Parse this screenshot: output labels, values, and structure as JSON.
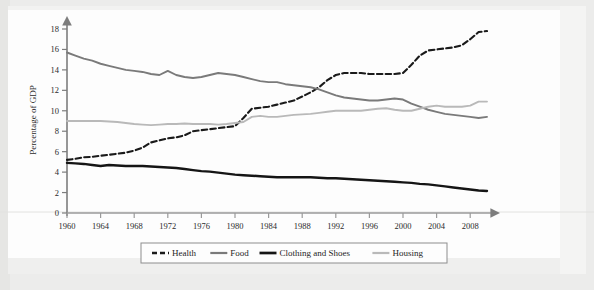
{
  "figure": {
    "background_color": "#ececeb",
    "paper_color": "#fdfdfd",
    "axis_color": "#6b6b6b"
  },
  "chart_data": {
    "type": "line",
    "title": "",
    "subtitle": "",
    "xlabel": "",
    "ylabel": "Percentage of GDP",
    "xlim": [
      1960,
      2010
    ],
    "ylim": [
      0,
      18
    ],
    "ytick_values": [
      0,
      2,
      4,
      6,
      8,
      10,
      12,
      14,
      16,
      18
    ],
    "ytick_labels": [
      "0",
      "2",
      "4",
      "6",
      "8",
      "10",
      "12",
      "14",
      "16",
      "18"
    ],
    "xtick_values": [
      1960,
      1964,
      1968,
      1972,
      1976,
      1980,
      1984,
      1988,
      1992,
      1996,
      2000,
      2004,
      2008
    ],
    "xtick_labels": [
      "1960",
      "1964",
      "1968",
      "1972",
      "1976",
      "1980",
      "1984",
      "1988",
      "1992",
      "1996",
      "2000",
      "2004",
      "2008"
    ],
    "grid": false,
    "legend_position": "bottom",
    "x": [
      1960,
      1961,
      1962,
      1963,
      1964,
      1965,
      1966,
      1967,
      1968,
      1969,
      1970,
      1971,
      1972,
      1973,
      1974,
      1975,
      1976,
      1977,
      1978,
      1979,
      1980,
      1981,
      1982,
      1983,
      1984,
      1985,
      1986,
      1987,
      1988,
      1989,
      1990,
      1991,
      1992,
      1993,
      1994,
      1995,
      1996,
      1997,
      1998,
      1999,
      2000,
      2001,
      2002,
      2003,
      2004,
      2005,
      2006,
      2007,
      2008,
      2009,
      2010
    ],
    "series": [
      {
        "name": "Health",
        "style": "dashed",
        "color": "#1a1a1a",
        "width": 2.1,
        "values": [
          5.2,
          5.3,
          5.45,
          5.5,
          5.6,
          5.7,
          5.8,
          5.9,
          6.1,
          6.4,
          6.9,
          7.1,
          7.3,
          7.4,
          7.6,
          8.0,
          8.1,
          8.2,
          8.3,
          8.4,
          8.5,
          9.3,
          10.2,
          10.3,
          10.4,
          10.6,
          10.8,
          11.0,
          11.4,
          11.8,
          12.3,
          13.0,
          13.5,
          13.7,
          13.7,
          13.7,
          13.6,
          13.6,
          13.6,
          13.6,
          13.7,
          14.5,
          15.4,
          15.9,
          16.0,
          16.1,
          16.2,
          16.4,
          17.0,
          17.7,
          17.8
        ]
      },
      {
        "name": "Food",
        "style": "solid",
        "color": "#7a7a7a",
        "width": 1.9,
        "values": [
          15.7,
          15.4,
          15.1,
          14.9,
          14.6,
          14.4,
          14.2,
          14.0,
          13.9,
          13.8,
          13.6,
          13.5,
          13.9,
          13.5,
          13.3,
          13.2,
          13.3,
          13.5,
          13.7,
          13.6,
          13.5,
          13.3,
          13.1,
          12.9,
          12.8,
          12.8,
          12.6,
          12.5,
          12.4,
          12.3,
          12.1,
          11.8,
          11.5,
          11.3,
          11.2,
          11.1,
          11.0,
          11.0,
          11.1,
          11.2,
          11.1,
          10.7,
          10.4,
          10.1,
          9.9,
          9.7,
          9.6,
          9.5,
          9.4,
          9.3,
          9.4
        ]
      },
      {
        "name": "Clothing and Shoes",
        "style": "solid",
        "color": "#151515",
        "width": 2.4,
        "values": [
          4.9,
          4.85,
          4.8,
          4.7,
          4.6,
          4.7,
          4.65,
          4.6,
          4.6,
          4.6,
          4.55,
          4.5,
          4.45,
          4.4,
          4.3,
          4.2,
          4.1,
          4.05,
          3.95,
          3.85,
          3.75,
          3.7,
          3.65,
          3.6,
          3.55,
          3.5,
          3.5,
          3.5,
          3.5,
          3.5,
          3.45,
          3.4,
          3.4,
          3.35,
          3.3,
          3.25,
          3.2,
          3.15,
          3.1,
          3.05,
          3.0,
          2.95,
          2.85,
          2.8,
          2.7,
          2.6,
          2.5,
          2.4,
          2.3,
          2.2,
          2.15
        ]
      },
      {
        "name": "Housing",
        "style": "solid",
        "color": "#b9b9b9",
        "width": 1.9,
        "values": [
          9.0,
          9.0,
          9.0,
          9.0,
          9.0,
          8.95,
          8.9,
          8.8,
          8.7,
          8.65,
          8.6,
          8.65,
          8.7,
          8.7,
          8.75,
          8.7,
          8.7,
          8.7,
          8.65,
          8.7,
          8.8,
          8.9,
          9.4,
          9.5,
          9.4,
          9.4,
          9.5,
          9.6,
          9.65,
          9.7,
          9.8,
          9.9,
          10.0,
          10.0,
          10.0,
          10.0,
          10.1,
          10.2,
          10.25,
          10.1,
          10.0,
          10.0,
          10.2,
          10.4,
          10.5,
          10.4,
          10.4,
          10.4,
          10.5,
          10.9,
          10.9
        ]
      }
    ]
  },
  "legend": {
    "items": [
      {
        "label": "Health",
        "swatch": "dashed-black"
      },
      {
        "label": "Food",
        "swatch": "solid-gray"
      },
      {
        "label": "Clothing and Shoes",
        "swatch": "solid-black-thick"
      },
      {
        "label": "Housing",
        "swatch": "solid-lightgray"
      }
    ]
  }
}
